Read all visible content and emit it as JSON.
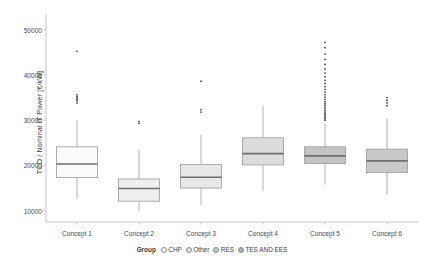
{
  "chart_data": {
    "type": "box",
    "title": "",
    "xlabel": "",
    "ylabel": "TCO / Nominal IT Power [€/kW]",
    "categories": [
      "Concept 1",
      "Concept 2",
      "Concept 3",
      "Concept 4",
      "Concept 5",
      "Concept 6"
    ],
    "ylim": [
      7500,
      53000
    ],
    "yticks": [
      10000,
      20000,
      30000,
      40000,
      50000
    ],
    "ytick_labels": [
      "10000",
      "20000",
      "30000",
      "40000",
      "50000"
    ],
    "grid": false,
    "legend_position": "bottom",
    "legend_title": "Group",
    "legend_entries": [
      {
        "label": "CHP",
        "color": "#f7f7f7"
      },
      {
        "label": "Other",
        "color": "#e0e0e0"
      },
      {
        "label": "RES",
        "color": "#c9c9c9"
      },
      {
        "label": "TES AND EES",
        "color": "#b0b0b0"
      }
    ],
    "boxes": [
      {
        "category": "Concept 1",
        "fill": "#fbfbfb",
        "whisker_low": 12600,
        "q1": 17300,
        "median": 20300,
        "q3": 24100,
        "whisker_high": 30000,
        "outliers": [
          33800,
          34300,
          34600,
          34900,
          35200,
          35600,
          45200
        ]
      },
      {
        "category": "Concept 2",
        "fill": "#efefef",
        "whisker_low": 9800,
        "q1": 12100,
        "median": 14900,
        "q3": 17000,
        "whisker_high": 23500,
        "outliers": [
          29300,
          29700
        ]
      },
      {
        "category": "Concept 3",
        "fill": "#e8e8e8",
        "whisker_low": 11200,
        "q1": 15000,
        "median": 17400,
        "q3": 20200,
        "whisker_high": 26800,
        "outliers": [
          31800,
          32300,
          38600
        ]
      },
      {
        "category": "Concept 4",
        "fill": "#dcdcdc",
        "whisker_low": 14300,
        "q1": 20100,
        "median": 22600,
        "q3": 26100,
        "whisker_high": 33200,
        "outliers": []
      },
      {
        "category": "Concept 5",
        "fill": "#c4c4c4",
        "whisker_low": 15800,
        "q1": 20400,
        "median": 22100,
        "q3": 24100,
        "whisker_high": 29400,
        "outliers": [
          30000,
          30300,
          30600,
          30900,
          31200,
          31500,
          31800,
          32100,
          32500,
          32900,
          33300,
          33700,
          34100,
          34600,
          35100,
          35600,
          36200,
          36800,
          37400,
          38100,
          38800,
          39600,
          40400,
          41300,
          42300,
          43400,
          44600,
          46000,
          47200
        ]
      },
      {
        "category": "Concept 6",
        "fill": "#c9c9c9",
        "whisker_low": 13500,
        "q1": 18400,
        "median": 21000,
        "q3": 23600,
        "whisker_high": 30300,
        "outliers": [
          33200,
          33800,
          34400,
          35000
        ]
      }
    ]
  },
  "axes": {
    "ylabel": "TCO / Nominal IT Power [€/kW]"
  },
  "legend": {
    "title": "Group",
    "items": [
      "CHP",
      "Other",
      "RES",
      "TES AND EES"
    ]
  }
}
